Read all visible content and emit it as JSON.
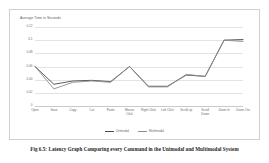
{
  "figure": {
    "caption": "Fig 6.5: Latency Graph Comparing every Command in the Unimodal and Multimodal System"
  },
  "chart_data": {
    "type": "line",
    "title": "",
    "axis_title": "Average Time in Seconds",
    "xlabel": "",
    "ylabel": "Average Time in Seconds",
    "ylim": [
      0,
      0.12
    ],
    "yticks": [
      "0.12",
      "0.1",
      "0.08",
      "0.06",
      "0.04",
      "0.02",
      "0"
    ],
    "ytick_values": [
      0.12,
      0.1,
      0.08,
      0.06,
      0.04,
      0.02,
      0
    ],
    "grid": true,
    "legend_position": "bottom",
    "categories": [
      "Open",
      "Save",
      "Copy",
      "Cut",
      "Paste",
      "Mouse\nClick",
      "Right Click",
      "Left Click",
      "Scroll up",
      "Scroll\nDown",
      "Zoom In",
      "Zoom Out"
    ],
    "series": [
      {
        "name": "Unimodal",
        "color": "#4a4a4a",
        "values": [
          0.06,
          0.033,
          0.038,
          0.039,
          0.037,
          0.06,
          0.03,
          0.03,
          0.047,
          0.045,
          0.1,
          0.101
        ]
      },
      {
        "name": "Multimodal",
        "color": "#8d8d8d",
        "values": [
          0.06,
          0.026,
          0.036,
          0.038,
          0.036,
          0.06,
          0.029,
          0.029,
          0.048,
          0.045,
          0.1,
          0.098
        ]
      }
    ]
  }
}
